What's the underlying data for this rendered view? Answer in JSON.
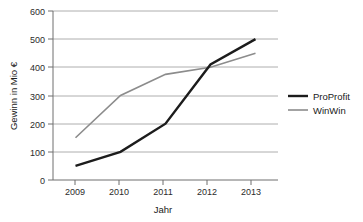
{
  "chart_data": {
    "type": "line",
    "title": "",
    "subtitle": "",
    "xlabel": "Jahr",
    "ylabel": "Gewinn in Mio €",
    "categories": [
      "2009",
      "2010",
      "2011",
      "2012",
      "2013"
    ],
    "x": [
      2009,
      2010,
      2011,
      2012,
      2013
    ],
    "xlim": [
      2008.5,
      2013.5
    ],
    "ylim": [
      0,
      600
    ],
    "yticks": [
      0,
      100,
      200,
      300,
      400,
      500,
      600
    ],
    "ytick_labels": [
      "0",
      "100",
      "200",
      "300",
      "400",
      "500",
      "600"
    ],
    "grid": "horizontal",
    "legend_position": "right",
    "series": [
      {
        "name": "ProProfit",
        "color": "#1c1c1c",
        "width": 2.4,
        "values": [
          50,
          100,
          200,
          410,
          500
        ]
      },
      {
        "name": "WinWin",
        "color": "#8c8c8c",
        "width": 1.6,
        "values": [
          150,
          300,
          375,
          400,
          450
        ]
      }
    ]
  },
  "axes": {
    "y_title": "Gewinn in Mio €",
    "x_title": "Jahr",
    "y_tick_labels": [
      "600",
      "500",
      "400",
      "300",
      "200",
      "100",
      "0"
    ],
    "x_tick_labels": [
      "2009",
      "2010",
      "2011",
      "2012",
      "2013"
    ]
  },
  "legend": {
    "entries": [
      {
        "label": "ProProfit",
        "color": "#1c1c1c"
      },
      {
        "label": "WinWin",
        "color": "#8c8c8c"
      }
    ]
  },
  "colors": {
    "background": "#ffffff",
    "grid": "#9a9a9a",
    "axis": "#6e6e6e",
    "text": "#1a1a1a",
    "series_1": "#1c1c1c",
    "series_2": "#8c8c8c"
  }
}
